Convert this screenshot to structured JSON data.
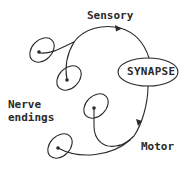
{
  "diagram": {
    "labels": {
      "sensory": "Sensory",
      "synapse": "SYNAPSE",
      "nerve_line1": "Nerve",
      "nerve_line2": "endings",
      "motor": "Motor"
    },
    "colors": {
      "stroke": "#2a2a2a",
      "text": "#2a2a2a",
      "background": "#ffffff"
    },
    "nodes": [
      {
        "id": "synapse",
        "type": "ellipse",
        "label": "SYNAPSE"
      },
      {
        "id": "nerve-ending-1",
        "type": "nerve-ending",
        "pathway": "sensory"
      },
      {
        "id": "nerve-ending-2",
        "type": "nerve-ending",
        "pathway": "sensory"
      },
      {
        "id": "nerve-ending-3",
        "type": "nerve-ending",
        "pathway": "motor"
      },
      {
        "id": "nerve-ending-4",
        "type": "nerve-ending",
        "pathway": "motor"
      }
    ],
    "edges": [
      {
        "from": "nerve-ending-1",
        "to": "synapse",
        "label": "Sensory",
        "arrow": true
      },
      {
        "from": "nerve-ending-2",
        "to": "synapse",
        "label": "Sensory",
        "arrow": true
      },
      {
        "from": "synapse",
        "to": "nerve-ending-3",
        "label": "Motor",
        "arrow": true
      },
      {
        "from": "synapse",
        "to": "nerve-ending-4",
        "label": "Motor",
        "arrow": true
      }
    ]
  }
}
